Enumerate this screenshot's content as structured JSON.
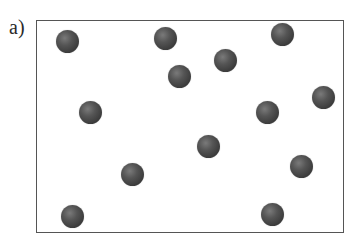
{
  "figure": {
    "panel_label": "a)",
    "container": {
      "left": 36,
      "top": 20,
      "right": 344,
      "bottom": 233,
      "border_color": "#555555"
    },
    "particle_color": "#4a4a4a",
    "particle_radius": 11.5,
    "particles": [
      {
        "x": 67,
        "y": 41
      },
      {
        "x": 165,
        "y": 38
      },
      {
        "x": 282,
        "y": 34
      },
      {
        "x": 225,
        "y": 60
      },
      {
        "x": 179,
        "y": 76
      },
      {
        "x": 323,
        "y": 97
      },
      {
        "x": 90,
        "y": 112
      },
      {
        "x": 267,
        "y": 112
      },
      {
        "x": 208,
        "y": 146
      },
      {
        "x": 301,
        "y": 166
      },
      {
        "x": 132,
        "y": 174
      },
      {
        "x": 72,
        "y": 216
      },
      {
        "x": 272,
        "y": 214
      }
    ]
  }
}
